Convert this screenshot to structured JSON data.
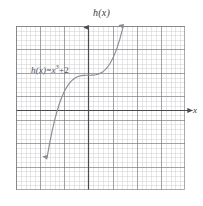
{
  "figure": {
    "background_color": "#ffffff",
    "axis_color": "#4a4a52",
    "curve_color": "#8c8c94",
    "grid_major_color": "#787880",
    "grid_minor_color": "#969699"
  },
  "axes": {
    "y_title": "h(x)",
    "x_title": "x",
    "x_arrow": "right-arrowhead",
    "y_arrow": "up-arrowhead"
  },
  "annotation": {
    "equation_lhs": "h(x)",
    "equation_equals": "=",
    "equation_base": "x",
    "equation_exponent": "3",
    "equation_plus": "+",
    "equation_constant": "2",
    "equation_full": "h(x) = x³ + 2"
  },
  "chart_data": {
    "type": "line",
    "title": "h(x)",
    "xlabel": "x",
    "ylabel": "h(x)",
    "expression": "h(x) = x^3 + 2",
    "xlim": [
      -3,
      4
    ],
    "ylim": [
      -5,
      5
    ],
    "grid": true,
    "grid_major_step": 1,
    "grid_minor_subdivisions": 5,
    "legend": "none",
    "annotations": [
      {
        "text": "h(x) = x³ + 2",
        "x": -2.3,
        "y": 3.05
      }
    ],
    "series": [
      {
        "name": "h(x) = x^3 + 2",
        "arrow_start": "down",
        "arrow_end": "up",
        "x": [
          -1.71,
          -1.6,
          -1.5,
          -1.4,
          -1.3,
          -1.2,
          -1.1,
          -1.0,
          -0.9,
          -0.8,
          -0.7,
          -0.6,
          -0.5,
          -0.4,
          -0.3,
          -0.2,
          -0.1,
          0.0,
          0.1,
          0.2,
          0.3,
          0.4,
          0.5,
          0.6,
          0.7,
          0.8,
          0.9,
          1.0,
          1.1,
          1.2,
          1.3,
          1.4,
          1.44
        ],
        "y": [
          -3.0,
          -2.096,
          -1.375,
          -0.744,
          -0.197,
          0.272,
          0.669,
          1.0,
          1.271,
          1.488,
          1.657,
          1.784,
          1.875,
          1.936,
          1.973,
          1.992,
          1.999,
          2.0,
          2.001,
          2.008,
          2.027,
          2.064,
          2.125,
          2.216,
          2.343,
          2.512,
          2.729,
          3.0,
          3.331,
          3.728,
          4.197,
          4.744,
          4.986
        ]
      }
    ]
  }
}
